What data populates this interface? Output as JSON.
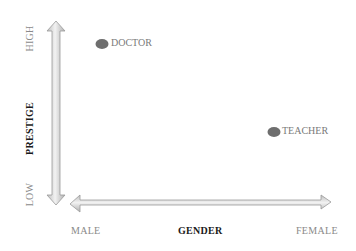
{
  "diagram": {
    "y_axis": {
      "title": "PRESTIGE",
      "high_label": "HIGH",
      "low_label": "LOW"
    },
    "x_axis": {
      "title": "GENDER",
      "left_label": "MALE",
      "right_label": "FEMALE"
    },
    "points": [
      {
        "label": "DOCTOR",
        "x_pos": "male",
        "y_pos": "high"
      },
      {
        "label": "TEACHER",
        "x_pos": "female",
        "y_pos": "mid"
      }
    ],
    "colors": {
      "arrow_fill": "#d8d8d8",
      "arrow_edge": "#9a9a9a",
      "dot": "#6e6e6e",
      "muted_text": "#8a8a8a",
      "title_text": "#1a1a1a"
    }
  }
}
